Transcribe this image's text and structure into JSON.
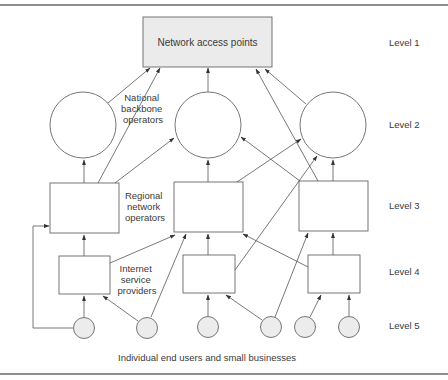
{
  "diagram": {
    "top_node": {
      "label": "Network access points",
      "fill": "#ebebeb"
    },
    "labels": {
      "national_backbone": [
        "National",
        "backbone",
        "operators"
      ],
      "regional_network": [
        "Regional",
        "network",
        "operators"
      ],
      "isp": [
        "Internet",
        "service",
        "providers"
      ],
      "end_users": "Individual end users and small businesses"
    },
    "levels": [
      "Level 1",
      "Level 2",
      "Level 3",
      "Level 4",
      "Level 5"
    ],
    "colors": {
      "line": "#555555",
      "nap_fill": "#ebebeb",
      "user_fill": "#ececec",
      "border": "#6a6a6a"
    },
    "nodes": {
      "level2_backbones": 3,
      "level3_regional": 3,
      "level4_isps": 3,
      "level5_users": 6
    }
  }
}
